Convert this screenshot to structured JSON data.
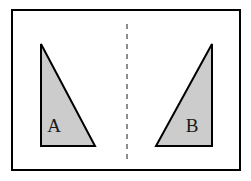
{
  "figure": {
    "canvas": {
      "width": 251,
      "height": 181,
      "background": "#ffffff"
    },
    "frame": {
      "name": "outer-border",
      "x": 12,
      "y": 10,
      "width": 228,
      "height": 160,
      "stroke": "#000000",
      "stroke_width": 2,
      "fill": "#ffffff"
    },
    "mirror_line": {
      "label": "line of symmetry",
      "orientation": "vertical",
      "x": 127,
      "y_start": 24,
      "y_end": 161,
      "stroke": "#8c8c8c",
      "stroke_width": 2,
      "dash": "5 5"
    },
    "shapes": [
      {
        "label": "A",
        "name": "triangle-a",
        "points": "41,44 41,146 95,146",
        "label_x": 54,
        "label_y": 128,
        "fill": "#cccccc",
        "stroke": "#000000",
        "stroke_width": 2,
        "right_angle_at": "bottom-left"
      },
      {
        "label": "B",
        "name": "triangle-b",
        "points": "212,44 212,146 156,146",
        "label_x": 192,
        "label_y": 128,
        "fill": "#cccccc",
        "stroke": "#000000",
        "stroke_width": 2,
        "right_angle_at": "bottom-right"
      }
    ]
  }
}
